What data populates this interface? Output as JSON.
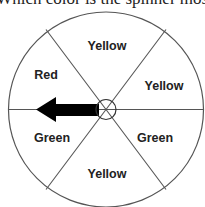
{
  "question": {
    "text": "Which color is the spinner most"
  },
  "spinner": {
    "sections": [
      {
        "label": "Yellow",
        "position": "top"
      },
      {
        "label": "Yellow",
        "position": "upper-right"
      },
      {
        "label": "Green",
        "position": "lower-right"
      },
      {
        "label": "Yellow",
        "position": "bottom"
      },
      {
        "label": "Green",
        "position": "lower-left"
      },
      {
        "label": "Red",
        "position": "upper-left"
      }
    ],
    "pointer": {
      "direction": "left",
      "color": "#000000"
    },
    "line_color": "#555555"
  }
}
